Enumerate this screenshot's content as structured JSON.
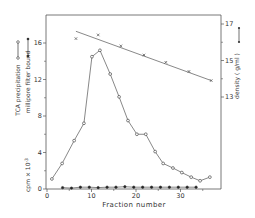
{
  "chart_data": {
    "type": "line",
    "title": "",
    "xlabel": "Fraction number",
    "ylabel_left": [
      "TCA precipitation",
      "millipore filter bound",
      "cpm × 10⁻³"
    ],
    "ylabel_right": "density ( g/ml )",
    "xlim": [
      0,
      38
    ],
    "ylim_left": [
      0,
      19
    ],
    "ylim_right": [
      12,
      17.5
    ],
    "x_ticks": [
      0,
      10,
      20,
      30
    ],
    "x_minor_ticks": [
      5,
      15,
      25,
      35
    ],
    "y_left_ticks": [
      0,
      4,
      8,
      12,
      16
    ],
    "y_left_minor_ticks": [
      2,
      6,
      10,
      14
    ],
    "y_right_ticks": [
      13,
      15,
      17
    ],
    "y_right_minor_ticks": [
      14,
      16
    ],
    "grid": false,
    "legend": "inline in axis labels",
    "series": [
      {
        "name": "TCA precipitation",
        "marker": "open-circle",
        "axis": "left",
        "x": [
          1.1,
          3.4,
          6.1,
          8.3,
          10.1,
          11.9,
          14.2,
          16.2,
          18.2,
          20.2,
          22.2,
          24.3,
          26.1,
          28.3,
          30.3,
          32.4,
          34.4,
          36.6
        ],
        "values": [
          1.1,
          2.8,
          5.3,
          7.2,
          14.5,
          15.2,
          12.6,
          10.1,
          7.5,
          6.0,
          6.0,
          4.1,
          2.8,
          2.3,
          1.8,
          1.3,
          0.9,
          1.3
        ]
      },
      {
        "name": "millipore filter bound",
        "marker": "filled-circle",
        "axis": "left",
        "x": [
          3.5,
          5.5,
          7.5,
          9.5,
          11.5,
          13.5,
          15.5,
          17.5,
          19.5,
          21.5,
          23.5,
          25.5,
          27.5,
          29.5,
          31.5,
          33.5
        ],
        "values": [
          0.15,
          0.1,
          0.2,
          0.2,
          0.15,
          0.2,
          0.2,
          0.25,
          0.2,
          0.2,
          0.2,
          0.2,
          0.2,
          0.2,
          0.2,
          0.2
        ]
      },
      {
        "name": "density (g/ml)",
        "marker": "cross",
        "axis": "right",
        "x": [
          6.5,
          11.5,
          16.6,
          21.8,
          26.7,
          31.9,
          36.9
        ],
        "values": [
          16.2,
          16.4,
          15.8,
          15.3,
          14.9,
          14.4,
          13.9
        ],
        "fit_line": {
          "x": [
            6.5,
            36.9
          ],
          "values": [
            16.6,
            13.9
          ]
        }
      }
    ]
  },
  "labels": {
    "x_axis": "Fraction number",
    "left_1": "TCA  precipitation",
    "left_2": "millipore  filter  bound",
    "left_3": "cpm × 10",
    "left_3_exp": "-3",
    "right": "density ( g/ml )"
  }
}
